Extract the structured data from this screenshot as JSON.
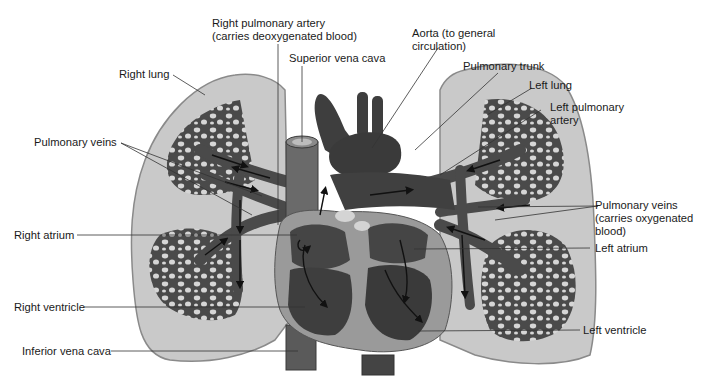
{
  "diagram": {
    "colors": {
      "background": "#ffffff",
      "lung_fill": "#c9c9c9",
      "lung_outline": "#8a8a8a",
      "vessel_dark": "#4a4a4a",
      "heart_wall": "#9a9a9a",
      "chamber": "#3e3e3e",
      "arrow": "#111111",
      "leader_line": "#333333"
    },
    "labels": {
      "right_pulmonary_artery_line1": "Right pulmonary artery",
      "right_pulmonary_artery_line2": "(carries deoxygenated blood)",
      "superior_vena_cava": "Superior vena cava",
      "aorta_line1": "Aorta (to general",
      "aorta_line2": "circulation)",
      "pulmonary_trunk": "Pulmonary trunk",
      "right_lung": "Right lung",
      "left_lung": "Left lung",
      "left_pulmonary_artery_line1": "Left pulmonary",
      "left_pulmonary_artery_line2": "artery",
      "pulmonary_veins_left": "Pulmonary veins",
      "pulmonary_veins_right_line1": "Pulmonary veins",
      "pulmonary_veins_right_line2": "(carries oxygenated",
      "pulmonary_veins_right_line3": "blood)",
      "right_atrium": "Right atrium",
      "left_atrium": "Left atrium",
      "right_ventricle": "Right ventricle",
      "left_ventricle": "Left ventricle",
      "inferior_vena_cava": "Inferior vena cava"
    }
  }
}
